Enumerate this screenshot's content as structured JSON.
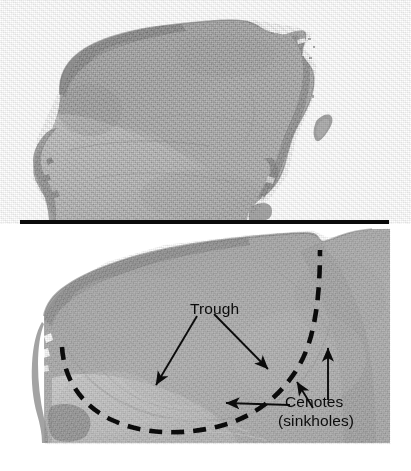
{
  "figure": {
    "panels": [
      {
        "id": "panel-top",
        "name": "unannotated-relief-image",
        "caption": ""
      },
      {
        "id": "panel-bottom",
        "name": "annotated-relief-closeup",
        "caption": ""
      }
    ]
  },
  "annotations": {
    "trough": {
      "label": "Trough",
      "arrow_count": 2
    },
    "cenotes": {
      "label": "Cenotes",
      "sublabel": "(sinkholes)",
      "arrow_count": 3
    }
  },
  "colors": {
    "land_mid": "#a9a9a9",
    "land_light": "#c6c6c6",
    "land_dark": "#8a8a8a",
    "annotation": "#0b0b0b",
    "separator": "#0a0a0a",
    "background": "#ffffff"
  },
  "elements": {
    "separator_bar": "horizontal-black-rule",
    "dashed_arc": "chicxulub-crater-rim-arc",
    "island": "offshore-island"
  }
}
